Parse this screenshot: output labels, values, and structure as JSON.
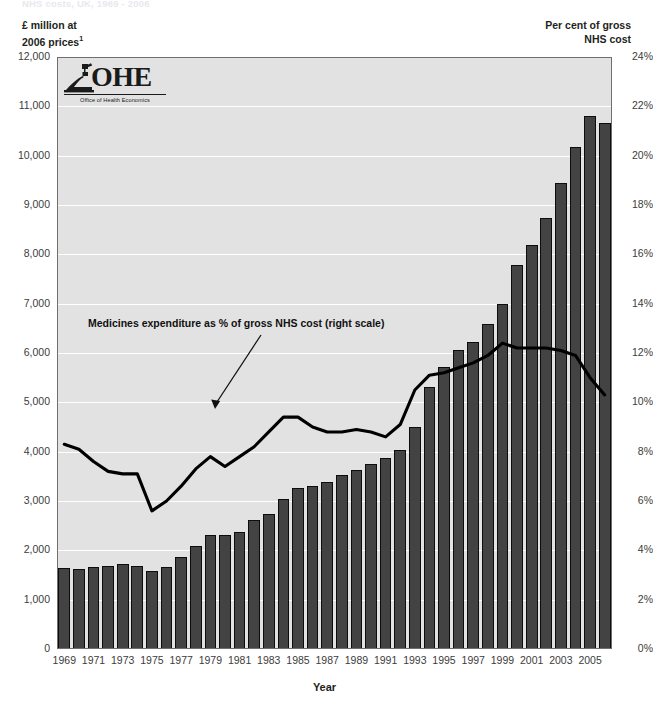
{
  "supertitle": "NHS costs, UK, 1969 - 2006",
  "axis_titles": {
    "left_line1": "£ million at",
    "left_line2": "2006 prices",
    "left_footnote": "1",
    "right_line1": "Per cent of gross",
    "right_line2": "NHS cost"
  },
  "logo": {
    "wordmark": "OHE",
    "subtitle": "Office of Health Economics"
  },
  "annotation": "Medicines expenditure as % of gross NHS cost (right scale)",
  "colors": {
    "plot_background": "#e2e2e2",
    "gridline": "#ffffff",
    "bar_fill": "#434343",
    "bar_stroke": "#0d0d0d",
    "line": "#000000",
    "text": "#231f20"
  },
  "chart_data": {
    "type": "bar",
    "title": "NHS costs, UK, 1969 - 2006",
    "xlabel": "Year",
    "ylabel": "£ million at 2006 prices",
    "y2label": "Per cent of gross NHS cost",
    "ylim": [
      0,
      12000
    ],
    "y2lim": [
      0,
      24
    ],
    "grid": true,
    "legend": "none",
    "yticks": [
      "0",
      "1,000",
      "2,000",
      "3,000",
      "4,000",
      "5,000",
      "6,000",
      "7,000",
      "8,000",
      "9,000",
      "10,000",
      "11,000",
      "12,000"
    ],
    "ytick_values": [
      0,
      1000,
      2000,
      3000,
      4000,
      5000,
      6000,
      7000,
      8000,
      9000,
      10000,
      11000,
      12000
    ],
    "y2ticks": [
      "0%",
      "2%",
      "4%",
      "6%",
      "8%",
      "10%",
      "12%",
      "14%",
      "16%",
      "18%",
      "20%",
      "22%",
      "24%"
    ],
    "y2tick_values": [
      0,
      2,
      4,
      6,
      8,
      10,
      12,
      14,
      16,
      18,
      20,
      22,
      24
    ],
    "categories": [
      1969,
      1970,
      1971,
      1972,
      1973,
      1974,
      1975,
      1976,
      1977,
      1978,
      1979,
      1980,
      1981,
      1982,
      1983,
      1984,
      1985,
      1986,
      1987,
      1988,
      1989,
      1990,
      1991,
      1992,
      1993,
      1994,
      1995,
      1996,
      1997,
      1998,
      1999,
      2000,
      2001,
      2002,
      2003,
      2004,
      2005,
      2006
    ],
    "xtick_labels": [
      "1969",
      "1971",
      "1973",
      "1975",
      "1977",
      "1979",
      "1981",
      "1983",
      "1985",
      "1987",
      "1989",
      "1991",
      "1993",
      "1995",
      "1997",
      "1999",
      "2001",
      "2003",
      "2005"
    ],
    "series": [
      {
        "name": "Medicines expenditure (£ million at 2006 prices)",
        "type": "bar",
        "axis": "left",
        "values": [
          1650,
          1630,
          1670,
          1680,
          1720,
          1690,
          1590,
          1660,
          1860,
          2090,
          2320,
          2320,
          2370,
          2620,
          2740,
          3050,
          3260,
          3310,
          3380,
          3520,
          3620,
          3760,
          3870,
          4030,
          4490,
          5320,
          5720,
          6070,
          6220,
          6580,
          7000,
          7780,
          8190,
          8730,
          9450,
          10180,
          10810,
          10670
        ]
      },
      {
        "name": "Medicines expenditure as % of gross NHS cost",
        "type": "line",
        "axis": "right",
        "values": [
          8.3,
          8.1,
          7.6,
          7.2,
          7.1,
          7.1,
          5.6,
          6.0,
          6.6,
          7.3,
          7.8,
          7.4,
          7.8,
          8.2,
          8.8,
          9.4,
          9.4,
          9.0,
          8.8,
          8.8,
          8.9,
          8.8,
          8.6,
          9.1,
          10.5,
          11.1,
          11.2,
          11.4,
          11.6,
          11.9,
          12.4,
          12.2,
          12.2,
          12.2,
          12.1,
          11.9,
          11.0,
          10.3
        ]
      }
    ]
  }
}
